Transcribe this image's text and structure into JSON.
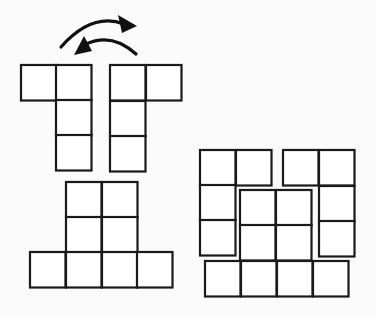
{
  "title": "",
  "diagram": {
    "cell_size": 36,
    "colors": {
      "stroke": "#1a1a1a",
      "fill": "#ffffff",
      "background": "#fbfbfb"
    },
    "arrows": [
      {
        "name": "arrow-right",
        "direction": "right",
        "path": "M61,46 Q95,10 134,25"
      },
      {
        "name": "arrow-left",
        "direction": "left",
        "path": "M136,54 Q108,30 78,50"
      }
    ],
    "pieces": [
      {
        "name": "left-piece",
        "cells": [
          [
            21,
            65
          ],
          [
            56,
            65
          ],
          [
            56,
            100
          ],
          [
            56,
            135
          ]
        ]
      },
      {
        "name": "right-piece",
        "cells": [
          [
            110,
            65
          ],
          [
            146,
            65
          ],
          [
            110,
            101
          ],
          [
            110,
            136
          ]
        ]
      },
      {
        "name": "figure-a-top-square",
        "cells": [
          [
            66,
            182
          ],
          [
            102,
            182
          ],
          [
            66,
            217
          ],
          [
            102,
            217
          ]
        ]
      },
      {
        "name": "figure-a-bottom-row",
        "cells": [
          [
            30,
            252
          ],
          [
            66,
            252
          ],
          [
            102,
            252
          ],
          [
            137,
            252
          ]
        ]
      },
      {
        "name": "figure-b-left-piece",
        "cells": [
          [
            200,
            150
          ],
          [
            236,
            150
          ],
          [
            200,
            185
          ],
          [
            200,
            220
          ]
        ]
      },
      {
        "name": "figure-b-right-piece",
        "cells": [
          [
            283,
            150
          ],
          [
            319,
            150
          ],
          [
            319,
            186
          ],
          [
            319,
            221
          ]
        ]
      },
      {
        "name": "figure-b-center-square",
        "cells": [
          [
            240,
            190
          ],
          [
            276,
            190
          ],
          [
            240,
            225
          ],
          [
            276,
            225
          ]
        ]
      },
      {
        "name": "figure-b-bottom-row",
        "cells": [
          [
            205,
            261
          ],
          [
            241,
            261
          ],
          [
            277,
            261
          ],
          [
            313,
            261
          ]
        ]
      }
    ]
  }
}
